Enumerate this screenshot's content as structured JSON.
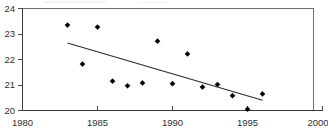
{
  "chart_data": {
    "type": "scatter",
    "title": "",
    "subtitle": "",
    "xlabel": "",
    "ylabel": "",
    "x": [
      1983,
      1984,
      1985,
      1986,
      1987,
      1988,
      1989,
      1990,
      1991,
      1992,
      1993,
      1994,
      1995,
      1996
    ],
    "values": [
      23.35,
      21.82,
      23.27,
      21.15,
      20.97,
      21.08,
      22.72,
      21.05,
      22.22,
      20.92,
      21.02,
      20.58,
      20.05,
      20.65
    ],
    "series": [
      {
        "name": "observations",
        "type": "scatter",
        "x": [
          1983,
          1984,
          1985,
          1986,
          1987,
          1988,
          1989,
          1990,
          1991,
          1992,
          1993,
          1994,
          1995,
          1996
        ],
        "values": [
          23.35,
          21.82,
          23.27,
          21.15,
          20.97,
          21.08,
          22.72,
          21.05,
          22.22,
          20.92,
          21.02,
          20.58,
          20.05,
          20.65
        ],
        "marker": "diamond",
        "color": "#000000"
      },
      {
        "name": "trend-line",
        "type": "line",
        "x": [
          1983,
          1996
        ],
        "values": [
          22.65,
          20.4
        ],
        "color": "#2b2b2b"
      }
    ],
    "xlim": [
      1980,
      2000
    ],
    "ylim": [
      20,
      24
    ],
    "xticks": [
      1980,
      1985,
      1990,
      1995,
      2000
    ],
    "yticks": [
      20,
      21,
      22,
      23,
      24
    ],
    "xtick_labels": [
      "1980",
      "1985",
      "1990",
      "1995",
      "2000"
    ],
    "ytick_labels": [
      "20",
      "21",
      "22",
      "23",
      "24"
    ],
    "grid": false,
    "legend": false,
    "legend_position": "none",
    "colors": {
      "point": "#000000",
      "trend": "#2b2b2b",
      "axis": "#3a3a3a",
      "frame": "#6f6f6f",
      "text": "#2f2f2f",
      "background": "#ffffff"
    }
  }
}
